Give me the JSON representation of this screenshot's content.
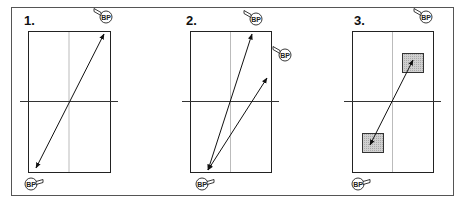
{
  "colors": {
    "background": "#ffffff",
    "frame": "#555555",
    "rect_border": "#222222",
    "center_vertical": "#bbbbbb",
    "horizontal_axis": "#333333",
    "arrow": "#111111",
    "shaded_fill": "#c8c8c8",
    "shaded_border": "#333333"
  },
  "frame": {
    "x": 11,
    "y": 7,
    "w": 442,
    "h": 188
  },
  "marker_text": "BP",
  "panels": [
    {
      "label": "1.",
      "label_pos": [
        24,
        25
      ],
      "rect": {
        "x": 28,
        "y": 31,
        "w": 82,
        "h": 141
      },
      "axis_y": 101,
      "axis_x1": 20,
      "axis_x2": 118,
      "arrows": [
        {
          "x1": 36,
          "y1": 168,
          "x2": 104,
          "y2": 34,
          "double": true
        }
      ],
      "shaded": [],
      "markers": [
        {
          "x": 106,
          "y": 17,
          "dir": "left"
        },
        {
          "x": 31,
          "y": 184,
          "dir": "right"
        }
      ]
    },
    {
      "label": "2.",
      "label_pos": [
        186,
        25
      ],
      "rect": {
        "x": 190,
        "y": 31,
        "w": 81,
        "h": 141
      },
      "axis_y": 101,
      "axis_x1": 182,
      "axis_x2": 279,
      "arrows": [
        {
          "x1": 208,
          "y1": 170,
          "x2": 252,
          "y2": 34,
          "double": true
        },
        {
          "x1": 208,
          "y1": 170,
          "x2": 267,
          "y2": 78,
          "double": true
        }
      ],
      "shaded": [],
      "markers": [
        {
          "x": 256,
          "y": 19,
          "dir": "left"
        },
        {
          "x": 285,
          "y": 55,
          "dir": "left"
        },
        {
          "x": 202,
          "y": 184,
          "dir": "right"
        }
      ]
    },
    {
      "label": "3.",
      "label_pos": [
        354,
        25
      ],
      "rect": {
        "x": 352,
        "y": 31,
        "w": 81,
        "h": 141
      },
      "axis_y": 101,
      "axis_x1": 344,
      "axis_x2": 441,
      "arrows": [
        {
          "x1": 370,
          "y1": 145,
          "x2": 413,
          "y2": 60,
          "double": true
        }
      ],
      "shaded": [
        {
          "x": 402,
          "y": 53,
          "w": 21,
          "h": 19
        },
        {
          "x": 362,
          "y": 133,
          "w": 21,
          "h": 19
        }
      ],
      "markers": [
        {
          "x": 426,
          "y": 17,
          "dir": "left"
        },
        {
          "x": 358,
          "y": 184,
          "dir": "right"
        }
      ]
    }
  ]
}
